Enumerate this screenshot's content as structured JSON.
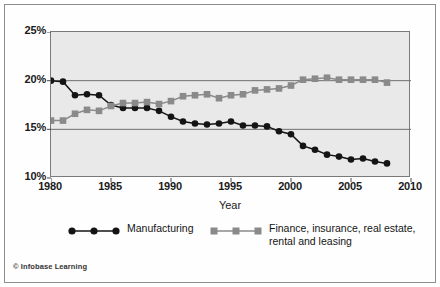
{
  "credit": "© Infobase Learning",
  "axis": {
    "x_title": "Year",
    "x_ticks": [
      "1980",
      "1985",
      "1990",
      "1995",
      "2000",
      "2005",
      "2010"
    ],
    "y_ticks": [
      "25%",
      "20%",
      "15%",
      "10%"
    ]
  },
  "legend": {
    "items": [
      {
        "label": "Manufacturing",
        "marker": "circle",
        "color": "#141414"
      },
      {
        "label": "Finance, insurance, real estate,\nrental and leasing",
        "marker": "square",
        "color": "#8a8a8a"
      }
    ]
  },
  "chart_data": {
    "type": "line",
    "title": "",
    "subtitle": "",
    "xlabel": "Year",
    "ylabel": "",
    "xlim": [
      1980,
      2010
    ],
    "ylim": [
      10,
      25
    ],
    "grid": true,
    "legend_position": "bottom",
    "y_tick_values": [
      25,
      20,
      15,
      10
    ],
    "y_tick_labels": [
      "25%",
      "20%",
      "15%",
      "10%"
    ],
    "x_tick_values": [
      1980,
      1985,
      1990,
      1995,
      2000,
      2005,
      2010
    ],
    "x_tick_labels": [
      "1980",
      "1985",
      "1990",
      "1995",
      "2000",
      "2005",
      "2010"
    ],
    "x": [
      1980,
      1981,
      1982,
      1983,
      1984,
      1985,
      1986,
      1987,
      1988,
      1989,
      1990,
      1991,
      1992,
      1993,
      1994,
      1995,
      1996,
      1997,
      1998,
      1999,
      2000,
      2001,
      2002,
      2003,
      2004,
      2005,
      2006,
      2007,
      2008
    ],
    "series": [
      {
        "name": "Manufacturing",
        "marker": "circle",
        "color": "#141414",
        "values": [
          20.0,
          19.9,
          18.5,
          18.6,
          18.5,
          17.5,
          17.2,
          17.2,
          17.2,
          16.9,
          16.3,
          15.8,
          15.6,
          15.5,
          15.6,
          15.8,
          15.4,
          15.4,
          15.3,
          14.8,
          14.5,
          13.3,
          12.9,
          12.4,
          12.2,
          11.9,
          12.0,
          11.7,
          11.5
        ]
      },
      {
        "name": "Finance, insurance, real estate, rental and leasing",
        "marker": "square",
        "color": "#8a8a8a",
        "values": [
          15.9,
          15.9,
          16.6,
          17.0,
          16.9,
          17.4,
          17.7,
          17.7,
          17.8,
          17.6,
          17.9,
          18.4,
          18.5,
          18.6,
          18.2,
          18.5,
          18.6,
          19.0,
          19.1,
          19.2,
          19.5,
          20.1,
          20.2,
          20.3,
          20.1,
          20.1,
          20.1,
          20.1,
          19.8
        ]
      }
    ]
  }
}
